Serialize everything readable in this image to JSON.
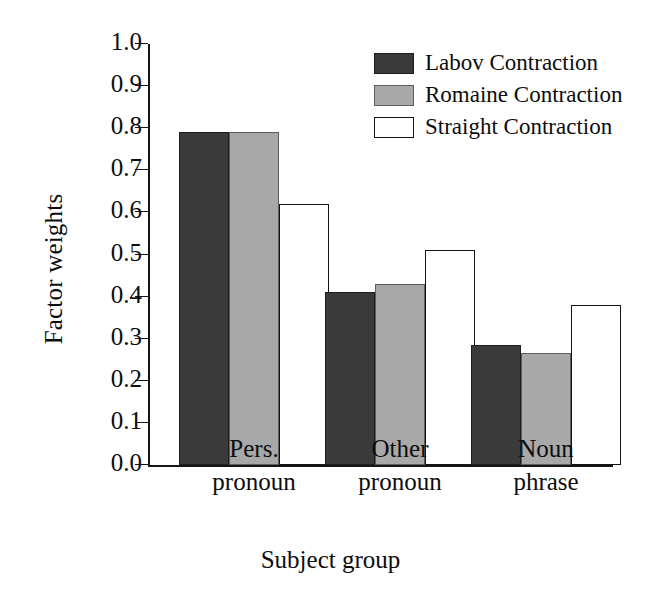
{
  "chart_data": {
    "type": "bar",
    "title": "",
    "xlabel": "Subject group",
    "ylabel": "Factor weights",
    "categories": [
      "Pers. pronoun",
      "Other pronoun",
      "Noun phrase"
    ],
    "category_lines": [
      [
        "Pers.",
        "pronoun"
      ],
      [
        "Other",
        "pronoun"
      ],
      [
        "Noun",
        "phrase"
      ]
    ],
    "series": [
      {
        "name": "Labov Contraction",
        "values": [
          0.79,
          0.41,
          0.285
        ],
        "color": "#3a3a3a"
      },
      {
        "name": "Romaine Contraction",
        "values": [
          0.79,
          0.43,
          0.265
        ],
        "color": "#a8a8a8"
      },
      {
        "name": "Straight Contraction",
        "values": [
          0.62,
          0.51,
          0.38
        ],
        "color": "#ffffff"
      }
    ],
    "ylim": [
      0.0,
      1.0
    ],
    "yticks": [
      0.0,
      0.1,
      0.2,
      0.3,
      0.4,
      0.5,
      0.6,
      0.7,
      0.8,
      0.9,
      1.0
    ],
    "ytick_labels": [
      "0.0",
      "0.1",
      "0.2",
      "0.3",
      "0.4",
      "0.5",
      "0.6",
      "0.7",
      "0.8",
      "0.9",
      "1.0"
    ],
    "grid": false,
    "legend_position": "top-right",
    "legend_entries": [
      "Labov Contraction",
      "Romaine Contraction",
      "Straight Contraction"
    ]
  }
}
